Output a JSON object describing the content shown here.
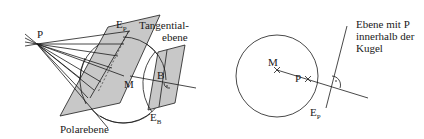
{
  "figure_left": {
    "title": "Polar plane construction for a point outside the sphere",
    "labels": {
      "point": "P",
      "polar_plane_top": "E",
      "polar_plane_top_sub": "P",
      "tangent_line1": "Tangential-",
      "tangent_line2": "ebene",
      "center": "M",
      "touch_point": "B",
      "tangent_plane": "E",
      "tangent_plane_sub": "B",
      "polar_plane_name": "Polarebene"
    }
  },
  "figure_right": {
    "title": "Plane through P inside the sphere",
    "labels": {
      "center": "M",
      "point": "P",
      "plane": "E",
      "plane_sub": "P",
      "caption_line1": "Ebene mit P",
      "caption_line2": "innerhalb der",
      "caption_line3": "Kugel"
    }
  },
  "colors": {
    "stroke": "#1a1a1a",
    "plane_fill": "#c8c8c8",
    "background": "#ffffff"
  }
}
